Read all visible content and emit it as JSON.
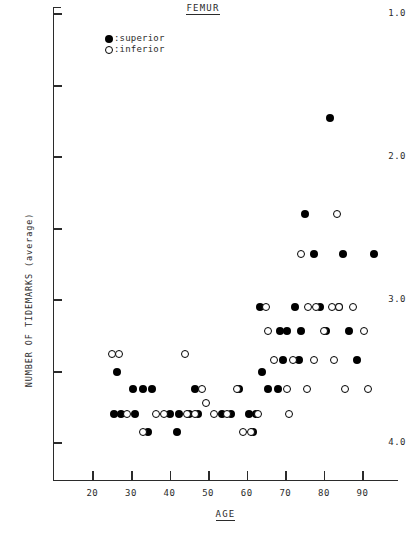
{
  "chart_data": {
    "type": "scatter",
    "title": "FEMUR",
    "xlabel": "AGE",
    "ylabel": "NUMBER OF TIDEMARKS  (average)",
    "xlim": [
      9.8,
      99.2
    ],
    "ylim": [
      0.75,
      4.05
    ],
    "xticks": [
      20,
      30,
      40,
      50,
      60,
      70,
      80,
      90
    ],
    "yticks": [
      1.0,
      2.0,
      3.0,
      4.0
    ],
    "yticks_minor": [
      1.5,
      2.5,
      3.5
    ],
    "grid": false,
    "legend_position": "upper-left-inside",
    "series": [
      {
        "name": "superior",
        "marker": "filled-circle",
        "color": "#000000",
        "points": [
          [
            26.5,
            1.5
          ],
          [
            25.5,
            1.2
          ],
          [
            27.5,
            1.2
          ],
          [
            30.5,
            1.38
          ],
          [
            33.0,
            1.38
          ],
          [
            35.5,
            1.38
          ],
          [
            31.0,
            1.2
          ],
          [
            34.5,
            1.08
          ],
          [
            40.0,
            1.2
          ],
          [
            42.5,
            1.2
          ],
          [
            45.0,
            1.2
          ],
          [
            47.5,
            1.2
          ],
          [
            42.0,
            1.08
          ],
          [
            46.5,
            1.38
          ],
          [
            53.5,
            1.2
          ],
          [
            56.0,
            1.2
          ],
          [
            58.0,
            1.38
          ],
          [
            60.5,
            1.2
          ],
          [
            62.5,
            1.2
          ],
          [
            61.5,
            1.08
          ],
          [
            63.5,
            1.95
          ],
          [
            65.5,
            1.38
          ],
          [
            64.0,
            1.5
          ],
          [
            68.5,
            1.78
          ],
          [
            70.5,
            1.78
          ],
          [
            69.5,
            1.58
          ],
          [
            68.0,
            1.38
          ],
          [
            72.5,
            1.95
          ],
          [
            74.0,
            1.78
          ],
          [
            73.5,
            1.58
          ],
          [
            75.0,
            2.6
          ],
          [
            77.5,
            2.32
          ],
          [
            79.0,
            1.95
          ],
          [
            80.5,
            1.78
          ],
          [
            81.5,
            3.27
          ],
          [
            84.0,
            1.95
          ],
          [
            85.0,
            2.32
          ],
          [
            86.5,
            1.78
          ],
          [
            88.5,
            1.58
          ],
          [
            93.0,
            2.32
          ]
        ]
      },
      {
        "name": "inferior",
        "marker": "open-circle",
        "color": "#000000",
        "points": [
          [
            25.0,
            1.62
          ],
          [
            27.0,
            1.62
          ],
          [
            29.0,
            1.2
          ],
          [
            36.5,
            1.2
          ],
          [
            38.5,
            1.2
          ],
          [
            33.0,
            1.08
          ],
          [
            44.0,
            1.62
          ],
          [
            44.5,
            1.2
          ],
          [
            46.5,
            1.2
          ],
          [
            48.5,
            1.38
          ],
          [
            49.5,
            1.28
          ],
          [
            51.5,
            1.2
          ],
          [
            55.0,
            1.2
          ],
          [
            57.5,
            1.38
          ],
          [
            59.0,
            1.08
          ],
          [
            61.0,
            1.08
          ],
          [
            63.0,
            1.2
          ],
          [
            65.0,
            1.95
          ],
          [
            65.5,
            1.78
          ],
          [
            67.0,
            1.58
          ],
          [
            70.5,
            1.38
          ],
          [
            72.0,
            1.58
          ],
          [
            71.0,
            1.2
          ],
          [
            74.0,
            2.32
          ],
          [
            76.0,
            1.95
          ],
          [
            78.0,
            1.95
          ],
          [
            77.5,
            1.58
          ],
          [
            75.5,
            1.38
          ],
          [
            80.0,
            1.78
          ],
          [
            82.0,
            1.95
          ],
          [
            84.0,
            1.95
          ],
          [
            83.5,
            2.6
          ],
          [
            82.5,
            1.58
          ],
          [
            85.5,
            1.38
          ],
          [
            87.5,
            1.95
          ],
          [
            90.5,
            1.78
          ],
          [
            91.5,
            1.38
          ]
        ]
      }
    ]
  },
  "legend": {
    "superior": {
      "marker": "filled-circle",
      "label": ":superior"
    },
    "inferior": {
      "marker": "open-circle",
      "label": ":inferior"
    }
  },
  "axes": {
    "y_tick_labels": [
      "4.0",
      "3.0",
      "2.0",
      "1.0"
    ],
    "x_tick_labels": [
      "20",
      "30",
      "40",
      "50",
      "60",
      "70",
      "80",
      "90"
    ]
  }
}
